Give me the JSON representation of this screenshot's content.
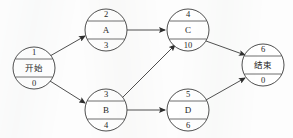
{
  "diagram": {
    "type": "directed-graph",
    "canvas": {
      "width": 293,
      "height": 138
    },
    "colors": {
      "background": "#fdfdfd",
      "stroke": "#3a3a3a",
      "text": "#1e1e1e",
      "arrow": "#2e2e2e"
    },
    "nodes": [
      {
        "id": "node-1",
        "number": "1",
        "label": "开始",
        "label_kind": "cjk",
        "duration": "0",
        "cx": 34,
        "cy": 68,
        "rx": 21,
        "ry": 21
      },
      {
        "id": "node-2",
        "number": "2",
        "label": "A",
        "label_kind": "latin",
        "duration": "3",
        "cx": 106,
        "cy": 30,
        "rx": 21,
        "ry": 21
      },
      {
        "id": "node-3",
        "number": "3",
        "label": "B",
        "label_kind": "latin",
        "duration": "4",
        "cx": 106,
        "cy": 110,
        "rx": 21,
        "ry": 21
      },
      {
        "id": "node-4",
        "number": "4",
        "label": "C",
        "label_kind": "latin",
        "duration": "10",
        "cx": 188,
        "cy": 30,
        "rx": 21,
        "ry": 21
      },
      {
        "id": "node-5",
        "number": "5",
        "label": "D",
        "label_kind": "latin",
        "duration": "6",
        "cx": 188,
        "cy": 110,
        "rx": 21,
        "ry": 21
      },
      {
        "id": "node-6",
        "number": "6",
        "label": "结束",
        "label_kind": "cjk",
        "duration": "0",
        "cx": 263,
        "cy": 65,
        "rx": 21,
        "ry": 21
      }
    ],
    "edges": [
      {
        "id": "edge-1-2",
        "from": "node-1",
        "to": "node-2",
        "x1": 50,
        "y1": 56,
        "x2": 87,
        "y2": 35
      },
      {
        "id": "edge-1-3",
        "from": "node-1",
        "to": "node-3",
        "x1": 50,
        "y1": 81,
        "x2": 87,
        "y2": 104
      },
      {
        "id": "edge-2-4",
        "from": "node-2",
        "to": "node-4",
        "x1": 127,
        "y1": 30,
        "x2": 167,
        "y2": 30
      },
      {
        "id": "edge-3-4",
        "from": "node-3",
        "to": "node-4",
        "x1": 124,
        "y1": 100,
        "x2": 176,
        "y2": 45
      },
      {
        "id": "edge-3-5",
        "from": "node-3",
        "to": "node-5",
        "x1": 127,
        "y1": 110,
        "x2": 167,
        "y2": 110
      },
      {
        "id": "edge-4-6",
        "from": "node-4",
        "to": "node-6",
        "x1": 206,
        "y1": 41,
        "x2": 247,
        "y2": 56
      },
      {
        "id": "edge-5-6",
        "from": "node-5",
        "to": "node-6",
        "x1": 206,
        "y1": 100,
        "x2": 247,
        "y2": 76
      }
    ]
  }
}
